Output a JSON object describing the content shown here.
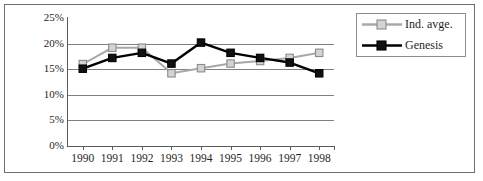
{
  "chart_data": {
    "type": "line",
    "title": "",
    "xlabel": "",
    "ylabel": "",
    "categories": [
      "1990",
      "1991",
      "1992",
      "1993",
      "1994",
      "1995",
      "1996",
      "1997",
      "1998"
    ],
    "ylim": [
      0,
      25
    ],
    "ytick_values": [
      0,
      5,
      10,
      15,
      20,
      25
    ],
    "ytick_labels": [
      "0%",
      "5%",
      "10%",
      "15%",
      "20%",
      "25%"
    ],
    "grid": "horizontal",
    "legend_position": "top-right",
    "series": [
      {
        "name": "Ind. avge.",
        "color": "#a8a8a8",
        "marker": "open-square",
        "marker_fill": "#d4d4d4",
        "values": [
          16.0,
          19.2,
          19.2,
          14.2,
          15.2,
          16.1,
          16.6,
          17.2,
          18.2
        ]
      },
      {
        "name": "Genesis",
        "color": "#000000",
        "marker": "filled-square",
        "marker_fill": "#111111",
        "values": [
          15.1,
          17.2,
          18.2,
          16.1,
          20.2,
          18.2,
          17.2,
          16.3,
          14.2
        ]
      }
    ]
  },
  "legend": {
    "items": [
      {
        "label": "Ind. avge."
      },
      {
        "label": "Genesis"
      }
    ]
  }
}
